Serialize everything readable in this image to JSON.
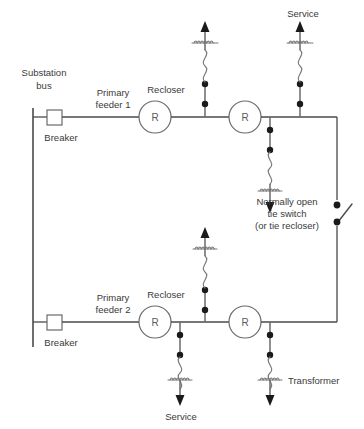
{
  "diagram": {
    "colors": {
      "wire": "#4a4a4a",
      "node": "#1a1a1a",
      "symbol_outline": "#6a6a6a",
      "text": "#3a3a3a",
      "background": "#ffffff"
    },
    "labels": {
      "substation_bus": "Substation",
      "substation_bus_2": "bus",
      "breaker_1": "Breaker",
      "breaker_2": "Breaker",
      "primary_feeder_1": "Primary",
      "primary_feeder_1_b": "feeder 1",
      "primary_feeder_2": "Primary",
      "primary_feeder_2_b": "feeder 2",
      "recloser_1": "Recloser",
      "recloser_2": "Recloser",
      "recloser_symbol": "R",
      "service_top": "Service",
      "service_bottom": "Service",
      "tie_switch_l1": "Normally open",
      "tie_switch_l2": "tie switch",
      "tie_switch_l3": "(or tie recloser)",
      "transformer": "Transformer"
    },
    "feeders": [
      {
        "name": "Primary feeder 1",
        "y": 117,
        "breaker": {
          "x": 54
        },
        "reclosers": [
          {
            "x": 155
          },
          {
            "x": 245
          }
        ],
        "laterals": [
          {
            "x": 205,
            "direction": "up",
            "label": ""
          },
          {
            "x": 300,
            "direction": "up",
            "label": "Service"
          },
          {
            "x": 270,
            "direction": "down",
            "label": ""
          }
        ]
      },
      {
        "name": "Primary feeder 2",
        "y": 322,
        "breaker": {
          "x": 54
        },
        "reclosers": [
          {
            "x": 155
          },
          {
            "x": 245
          }
        ],
        "laterals": [
          {
            "x": 205,
            "direction": "up",
            "label": ""
          },
          {
            "x": 180,
            "direction": "down",
            "label": "Service"
          },
          {
            "x": 270,
            "direction": "down",
            "label": "Transformer"
          }
        ]
      }
    ],
    "tie": {
      "x": 337,
      "state": "normally open",
      "node_top_y": 205,
      "node_bottom_y": 222
    }
  }
}
